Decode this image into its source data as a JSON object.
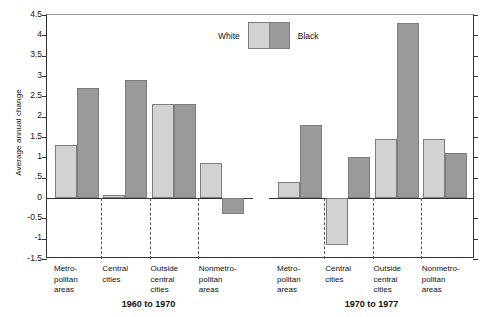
{
  "chart_data": {
    "type": "bar",
    "title": "",
    "xlabel": "",
    "ylabel": "Average annual change",
    "ylim": [
      -1.5,
      4.5
    ],
    "grid": false,
    "legend_position": "top-center",
    "y_ticks": [
      "4.5",
      "4",
      "3.5",
      "3",
      "2.5",
      "2",
      "1.5",
      "1",
      ".5",
      "0",
      "-0.5",
      "-1",
      "-1.5"
    ],
    "y_tick_values": [
      4.5,
      4,
      3.5,
      3,
      2.5,
      2,
      1.5,
      1,
      0.5,
      0,
      -0.5,
      -1,
      -1.5
    ],
    "legend": [
      "White",
      "Black"
    ],
    "panels": [
      {
        "period": "1960 to 1970",
        "categories": [
          "Metro-\npolitan\nareas",
          "Central\ncities",
          "Outside\ncentral\ncities",
          "Nonmetro-\npolitan\nareas"
        ],
        "series": [
          {
            "name": "White",
            "values": [
              1.3,
              0.08,
              2.32,
              0.85
            ]
          },
          {
            "name": "Black",
            "values": [
              2.7,
              2.9,
              2.32,
              -0.4
            ]
          }
        ]
      },
      {
        "period": "1970 to 1977",
        "categories": [
          "Metro-\npolitan\nareas",
          "Central\ncities",
          "Outside\ncentral\ncities",
          "Nonmetro-\npolitan\nareas"
        ],
        "series": [
          {
            "name": "White",
            "values": [
              0.4,
              -1.15,
              1.45,
              1.45
            ]
          },
          {
            "name": "Black",
            "values": [
              1.8,
              1.0,
              4.3,
              1.1
            ]
          }
        ]
      }
    ],
    "colors": {
      "white_series": "#d2d2d2",
      "black_series": "#9a9a9a",
      "bar_border": "#7d7d7d",
      "axis": "#333333",
      "separator": "#5a5a5a"
    }
  }
}
